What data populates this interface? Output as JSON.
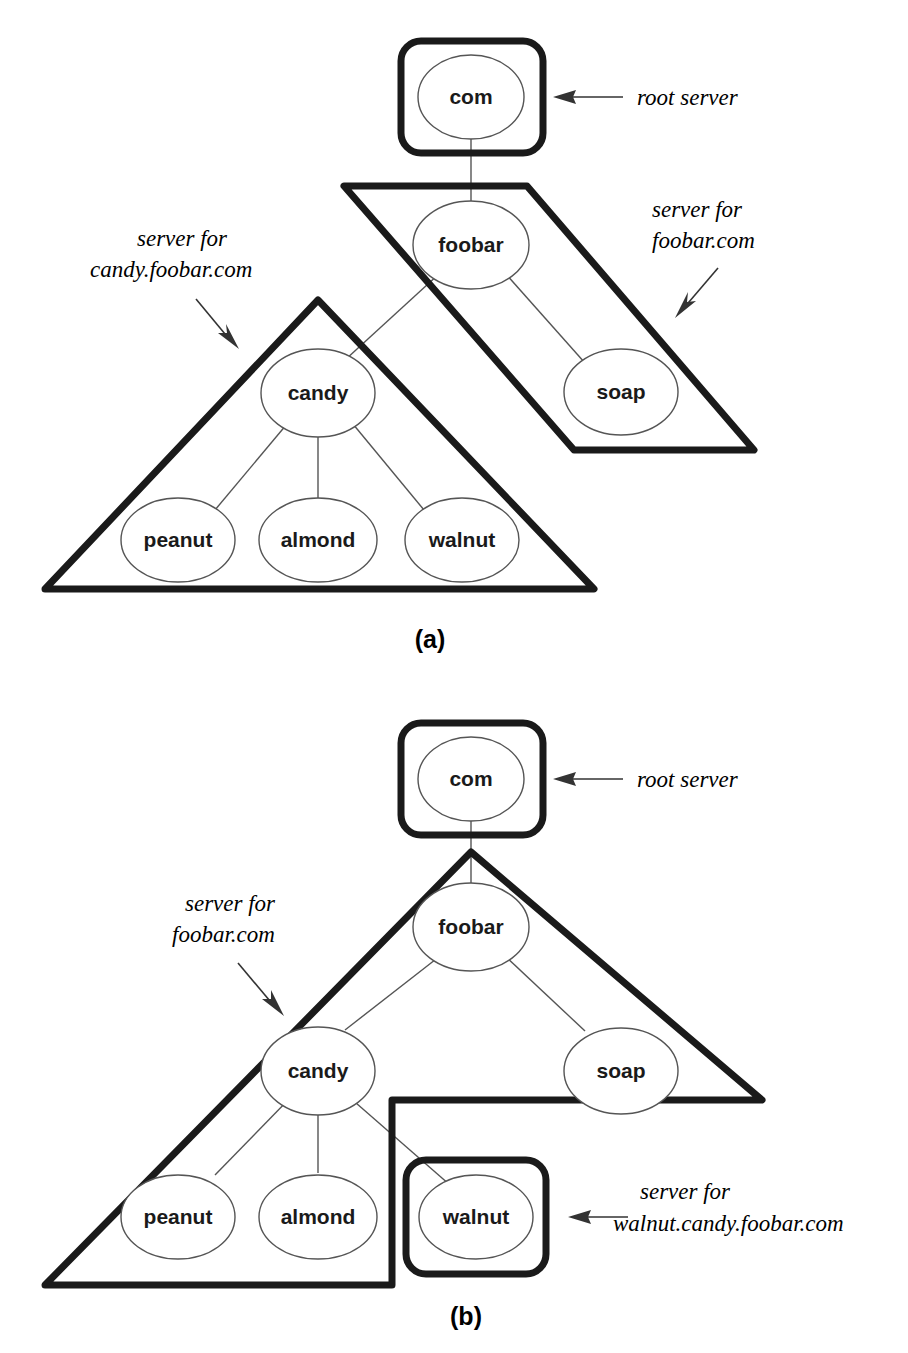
{
  "figure": {
    "background_color": "#ffffff",
    "region_stroke_color": "#1a1a1a",
    "node_stroke_color": "#555555",
    "edge_stroke_color": "#555555"
  },
  "panels": [
    {
      "id": "a",
      "caption": "(a)",
      "nodes": {
        "com": "com",
        "foobar": "foobar",
        "soap": "soap",
        "candy": "candy",
        "peanut": "peanut",
        "almond": "almond",
        "walnut": "walnut"
      },
      "annotations": {
        "root": "root server",
        "foobar_line1": "server for",
        "foobar_line2": "foobar.com",
        "candy_line1": "server for",
        "candy_line2": "candy.foobar.com"
      },
      "regions": [
        {
          "name": "root-server-region",
          "label": "root server",
          "shape": "rounded-box",
          "contains": [
            "com"
          ]
        },
        {
          "name": "foobar-server-region",
          "label": "server for foobar.com",
          "shape": "slanted-parallelogram",
          "contains": [
            "foobar",
            "soap"
          ]
        },
        {
          "name": "candy-server-region",
          "label": "server for candy.foobar.com",
          "shape": "rounded-triangle",
          "contains": [
            "candy",
            "peanut",
            "almond",
            "walnut"
          ]
        }
      ],
      "edges": [
        [
          "com",
          "foobar"
        ],
        [
          "foobar",
          "candy"
        ],
        [
          "foobar",
          "soap"
        ],
        [
          "candy",
          "peanut"
        ],
        [
          "candy",
          "almond"
        ],
        [
          "candy",
          "walnut"
        ]
      ]
    },
    {
      "id": "b",
      "caption": "(b)",
      "nodes": {
        "com": "com",
        "foobar": "foobar",
        "soap": "soap",
        "candy": "candy",
        "peanut": "peanut",
        "almond": "almond",
        "walnut": "walnut"
      },
      "annotations": {
        "root": "root server",
        "foobar_line1": "server for",
        "foobar_line2": "foobar.com",
        "walnut_line1": "server for",
        "walnut_line2": "walnut.candy.foobar.com"
      },
      "regions": [
        {
          "name": "root-server-region",
          "label": "root server",
          "shape": "rounded-box",
          "contains": [
            "com"
          ]
        },
        {
          "name": "foobar-server-region",
          "label": "server for foobar.com",
          "shape": "rounded-triangle-notched",
          "contains": [
            "foobar",
            "candy",
            "soap",
            "peanut",
            "almond"
          ]
        },
        {
          "name": "walnut-server-region",
          "label": "server for walnut.candy.foobar.com",
          "shape": "rounded-box",
          "contains": [
            "walnut"
          ]
        }
      ],
      "edges": [
        [
          "com",
          "foobar"
        ],
        [
          "foobar",
          "candy"
        ],
        [
          "foobar",
          "soap"
        ],
        [
          "candy",
          "peanut"
        ],
        [
          "candy",
          "almond"
        ],
        [
          "candy",
          "walnut"
        ]
      ]
    }
  ]
}
